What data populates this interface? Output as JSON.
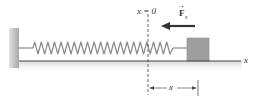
{
  "diagram": {
    "origin_label": "x = 0",
    "force_label": {
      "symbol": "F",
      "subscript": "s",
      "vector": true,
      "direction": "left"
    },
    "axis_label": "x",
    "displacement_label": "x",
    "components": [
      "wall",
      "spring",
      "block",
      "floor",
      "origin-dashed-line",
      "force-arrow",
      "displacement-dimension"
    ],
    "colors": {
      "wall": "#b8b8b8",
      "spring": "#8a8a8a",
      "block": "#9e9e9e",
      "floor_line": "#444444",
      "floor_shadow": "#dedede",
      "text": "#333333"
    }
  }
}
